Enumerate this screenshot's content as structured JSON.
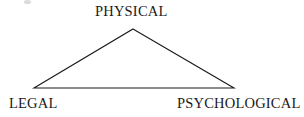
{
  "figure": {
    "type": "triangle-diagram",
    "background_color": "#ffffff",
    "width": 304,
    "height": 117,
    "stroke_color": "#1a1a1a",
    "stroke_width": 1.1,
    "fill": "none"
  },
  "labels": {
    "apex": "PHYSICAL",
    "bottom_left": "LEGAL",
    "bottom_right": "PSYCHOLOGICAL"
  },
  "vertices": {
    "apex": {
      "x": 133,
      "y": 29
    },
    "bottom_left": {
      "x": 34,
      "y": 88
    },
    "bottom_right": {
      "x": 234,
      "y": 88
    }
  },
  "artifact": {
    "name": "scan-speck",
    "x": 24,
    "y": 0,
    "color": "#cfcfcf"
  }
}
